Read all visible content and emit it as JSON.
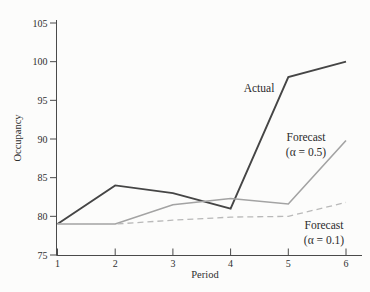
{
  "figure": {
    "background": "#fcfcfb",
    "axis_color": "#4a4a4a",
    "tick_label_color": "#2f2f2f",
    "annotation_color": "#2b2b2b"
  },
  "chart_data": {
    "type": "line",
    "title": "",
    "xlabel": "Period",
    "ylabel": "Occupancy",
    "x": [
      1,
      2,
      3,
      4,
      5,
      6
    ],
    "xlim": [
      1,
      6
    ],
    "ylim": [
      75,
      105
    ],
    "x_ticks": [
      1,
      2,
      3,
      4,
      5,
      6
    ],
    "y_ticks": [
      75,
      80,
      85,
      90,
      95,
      100,
      105
    ],
    "grid": false,
    "legend_position": "none (inline annotations)",
    "series": [
      {
        "name": "Actual",
        "values": [
          79,
          84,
          83,
          81,
          98,
          100
        ],
        "color": "#454545",
        "style": "solid",
        "width": 1.9
      },
      {
        "name": "Forecast (α = 0.5)",
        "values": [
          79,
          79,
          81.5,
          82.3,
          81.6,
          89.8
        ],
        "color": "#a3a3a3",
        "style": "solid",
        "width": 1.6
      },
      {
        "name": "Forecast (α = 0.1)",
        "values": [
          79,
          79,
          79.5,
          79.9,
          80.0,
          81.8
        ],
        "color": "#b9b9b9",
        "style": "dashed",
        "width": 1.3
      }
    ],
    "annotations": [
      {
        "text_lines": [
          "Actual"
        ],
        "x": 259,
        "y": 92
      },
      {
        "text_lines": [
          "Forecast",
          "(α = 0.5)"
        ],
        "x": 306,
        "y": 141
      },
      {
        "text_lines": [
          "Forecast",
          "(α = 0.1)"
        ],
        "x": 324,
        "y": 229
      }
    ]
  }
}
